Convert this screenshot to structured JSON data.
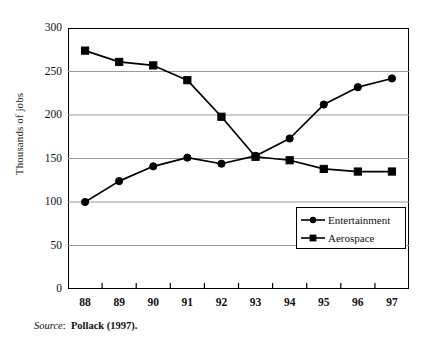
{
  "chart_data": {
    "type": "line",
    "title": "",
    "xlabel": "",
    "ylabel": "Thousands of jobs",
    "categories": [
      "88",
      "89",
      "90",
      "91",
      "92",
      "93",
      "94",
      "95",
      "96",
      "97"
    ],
    "x_tick_labels": [
      "88",
      "89",
      "90",
      "91",
      "92",
      "93",
      "94",
      "95",
      "96",
      "97"
    ],
    "y_tick_labels": [
      "0",
      "50",
      "100",
      "150",
      "200",
      "250",
      "300"
    ],
    "y_ticks": [
      0,
      50,
      100,
      150,
      200,
      250,
      300
    ],
    "ylim": [
      0,
      300
    ],
    "grid": "horizontal",
    "legend_position": "inside-lower-right",
    "series": [
      {
        "name": "Entertainment",
        "marker": "circle",
        "color": "#000000",
        "values": [
          100,
          124,
          141,
          151,
          144,
          153,
          173,
          212,
          232,
          242
        ]
      },
      {
        "name": "Aerospace",
        "marker": "square",
        "color": "#000000",
        "values": [
          274,
          261,
          257,
          240,
          198,
          152,
          148,
          138,
          135,
          135
        ]
      }
    ]
  },
  "legend": {
    "items": [
      {
        "label": "Entertainment",
        "marker": "circle"
      },
      {
        "label": "Aerospace",
        "marker": "square"
      }
    ]
  },
  "source": {
    "label": "Source",
    "separator": ":",
    "text": "Pollack (1997)."
  },
  "colors": {
    "axis": "#000000",
    "gridline": "#9a9a9a",
    "series": "#000000",
    "background": "#ffffff"
  }
}
